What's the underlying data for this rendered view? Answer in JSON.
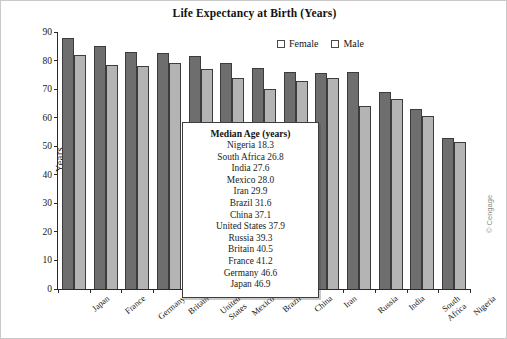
{
  "chart_data": {
    "type": "bar",
    "title": "Life Expectancy at Birth (Years)",
    "xlabel": "",
    "ylabel": "Years",
    "ylim": [
      0,
      90
    ],
    "yticks": [
      0,
      10,
      20,
      30,
      40,
      50,
      60,
      70,
      80,
      90
    ],
    "grid": false,
    "legend_position": "top-right",
    "categories": [
      "Japan",
      "France",
      "Germany",
      "Britain",
      "United States",
      "Mexico",
      "Brazil",
      "China",
      "Iran",
      "Russia",
      "India",
      "South Africa",
      "Nigeria"
    ],
    "series": [
      {
        "name": "Female",
        "color": "#6e6e6e",
        "values": [
          88,
          85,
          83,
          82.5,
          81.5,
          79,
          77.5,
          76,
          75.5,
          76,
          69,
          63,
          53
        ]
      },
      {
        "name": "Male",
        "color": "#b4b4b4",
        "values": [
          82,
          78.5,
          78,
          79,
          77,
          74,
          70,
          73,
          74,
          64,
          66.5,
          60.5,
          51.5
        ]
      }
    ]
  },
  "legend": {
    "entries": [
      {
        "label": "Female",
        "color": "#6e6e6e"
      },
      {
        "label": "Male",
        "color": "#b4b4b4"
      }
    ]
  },
  "inset": {
    "title": "Median Age (years)",
    "rows": [
      "Nigeria 18.3",
      "South Africa 26.8",
      "India 27.6",
      "Mexico 28.0",
      "Iran 29.9",
      "Brazil 31.6",
      "China 37.1",
      "United States 37.9",
      "Russia 39.3",
      "Britain 40.5",
      "France 41.2",
      "Germany 46.6",
      "Japan 46.9"
    ]
  },
  "credit": "© Cengage"
}
